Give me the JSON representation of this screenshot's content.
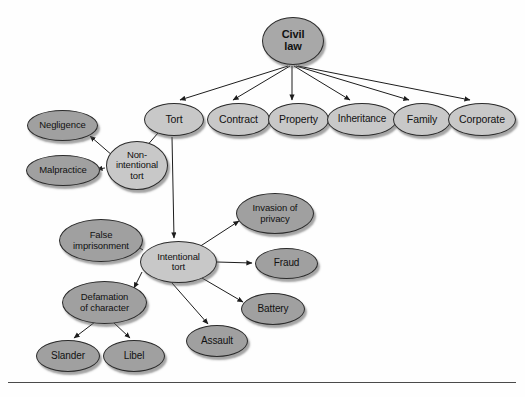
{
  "diagram": {
    "colors": {
      "root_fill": "#a8a8a8",
      "branch_fill": "#c8c8c8",
      "leaf_fill": "#a0a0a0",
      "stroke": "#2b2b2b",
      "background": "#fefefe",
      "baseline": "#4a4a4a"
    },
    "nodes": [
      {
        "id": "civil_law",
        "label": "Civil law",
        "lines": [
          "Civil",
          "law"
        ],
        "x": 262,
        "y": 17,
        "w": 62,
        "h": 48,
        "style": "root",
        "font": 11
      },
      {
        "id": "tort",
        "label": "Tort",
        "lines": [
          "Tort"
        ],
        "x": 144,
        "y": 103,
        "w": 60,
        "h": 33,
        "style": "light",
        "font": 10.5
      },
      {
        "id": "contract",
        "label": "Contract",
        "lines": [
          "Contract"
        ],
        "x": 207,
        "y": 103,
        "w": 63,
        "h": 33,
        "style": "light",
        "font": 10.5
      },
      {
        "id": "property",
        "label": "Property",
        "lines": [
          "Property"
        ],
        "x": 268,
        "y": 103,
        "w": 61,
        "h": 33,
        "style": "light",
        "font": 10.5
      },
      {
        "id": "inheritance",
        "label": "Inheritance",
        "lines": [
          "Inheritance"
        ],
        "x": 327,
        "y": 103,
        "w": 70,
        "h": 33,
        "style": "light",
        "font": 10
      },
      {
        "id": "family",
        "label": "Family",
        "lines": [
          "Family"
        ],
        "x": 393,
        "y": 103,
        "w": 58,
        "h": 33,
        "style": "light",
        "font": 10.5
      },
      {
        "id": "corporate",
        "label": "Corporate",
        "lines": [
          "Corporate"
        ],
        "x": 448,
        "y": 103,
        "w": 68,
        "h": 33,
        "style": "light",
        "font": 10.5
      },
      {
        "id": "non_intentional",
        "label": "Non-intentional tort",
        "lines": [
          "Non-",
          "intentional",
          "tort"
        ],
        "x": 106,
        "y": 141,
        "w": 62,
        "h": 49,
        "style": "light",
        "font": 9.5
      },
      {
        "id": "negligence",
        "label": "Negligence",
        "lines": [
          "Negligence"
        ],
        "x": 27,
        "y": 110,
        "w": 71,
        "h": 31,
        "style": "dark",
        "font": 9.5
      },
      {
        "id": "malpractice",
        "label": "Malpractice",
        "lines": [
          "Malpractice"
        ],
        "x": 26,
        "y": 155,
        "w": 74,
        "h": 31,
        "style": "dark",
        "font": 9.5
      },
      {
        "id": "intentional",
        "label": "Intentional tort",
        "lines": [
          "Intentional",
          "tort"
        ],
        "x": 140,
        "y": 241,
        "w": 77,
        "h": 42,
        "style": "light",
        "font": 9.5
      },
      {
        "id": "invasion_privacy",
        "label": "Invasion of privacy",
        "lines": [
          "Invasion of",
          "privacy"
        ],
        "x": 236,
        "y": 193,
        "w": 78,
        "h": 41,
        "style": "dark",
        "font": 9.5
      },
      {
        "id": "fraud",
        "label": "Fraud",
        "lines": [
          "Fraud"
        ],
        "x": 255,
        "y": 248,
        "w": 63,
        "h": 31,
        "style": "dark",
        "font": 10
      },
      {
        "id": "battery",
        "label": "Battery",
        "lines": [
          "Battery"
        ],
        "x": 241,
        "y": 293,
        "w": 64,
        "h": 32,
        "style": "dark",
        "font": 10
      },
      {
        "id": "assault",
        "label": "Assault",
        "lines": [
          "Assault"
        ],
        "x": 186,
        "y": 325,
        "w": 62,
        "h": 32,
        "style": "dark",
        "font": 10
      },
      {
        "id": "false_imprison",
        "label": "False imprisonment",
        "lines": [
          "False",
          "imprisonment"
        ],
        "x": 59,
        "y": 219,
        "w": 84,
        "h": 43,
        "style": "dark",
        "font": 9.5
      },
      {
        "id": "defamation",
        "label": "Defamation of character",
        "lines": [
          "Defamation",
          "of character"
        ],
        "x": 62,
        "y": 281,
        "w": 85,
        "h": 43,
        "style": "dark",
        "font": 9.5
      },
      {
        "id": "slander",
        "label": "Slander",
        "lines": [
          "Slander"
        ],
        "x": 36,
        "y": 340,
        "w": 64,
        "h": 32,
        "style": "dark",
        "font": 10
      },
      {
        "id": "libel",
        "label": "Libel",
        "lines": [
          "Libel"
        ],
        "x": 103,
        "y": 340,
        "w": 62,
        "h": 32,
        "style": "dark",
        "font": 10
      }
    ],
    "edges": [
      {
        "from": "civil_law",
        "to": "tort",
        "x1": 288,
        "y1": 66,
        "x2": 180,
        "y2": 100
      },
      {
        "from": "civil_law",
        "to": "contract",
        "x1": 290,
        "y1": 66,
        "x2": 233,
        "y2": 100
      },
      {
        "from": "civil_law",
        "to": "property",
        "x1": 292,
        "y1": 66,
        "x2": 292,
        "y2": 100
      },
      {
        "from": "civil_law",
        "to": "inheritance",
        "x1": 294,
        "y1": 66,
        "x2": 350,
        "y2": 100
      },
      {
        "from": "civil_law",
        "to": "family",
        "x1": 296,
        "y1": 66,
        "x2": 409,
        "y2": 100
      },
      {
        "from": "civil_law",
        "to": "corporate",
        "x1": 298,
        "y1": 66,
        "x2": 470,
        "y2": 100
      },
      {
        "from": "tort",
        "to": "non_intentional",
        "x1": 158,
        "y1": 133,
        "x2": 145,
        "y2": 148
      },
      {
        "from": "tort",
        "to": "intentional",
        "x1": 172,
        "y1": 137,
        "x2": 174,
        "y2": 238
      },
      {
        "from": "non_intentional",
        "to": "negligence",
        "x1": 113,
        "y1": 156,
        "x2": 90,
        "y2": 136
      },
      {
        "from": "non_intentional",
        "to": "malpractice",
        "x1": 105,
        "y1": 168,
        "x2": 97,
        "y2": 169
      },
      {
        "from": "intentional",
        "to": "invasion_privacy",
        "x1": 199,
        "y1": 247,
        "x2": 239,
        "y2": 221
      },
      {
        "from": "intentional",
        "to": "fraud",
        "x1": 217,
        "y1": 262,
        "x2": 252,
        "y2": 263
      },
      {
        "from": "intentional",
        "to": "battery",
        "x1": 202,
        "y1": 278,
        "x2": 243,
        "y2": 302
      },
      {
        "from": "intentional",
        "to": "assault",
        "x1": 172,
        "y1": 283,
        "x2": 208,
        "y2": 324
      },
      {
        "from": "intentional",
        "to": "false_imprison",
        "x1": 143,
        "y1": 250,
        "x2": 132,
        "y2": 243
      },
      {
        "from": "intentional",
        "to": "defamation",
        "x1": 142,
        "y1": 272,
        "x2": 134,
        "y2": 288
      },
      {
        "from": "defamation",
        "to": "slander",
        "x1": 95,
        "y1": 322,
        "x2": 74,
        "y2": 338
      },
      {
        "from": "defamation",
        "to": "libel",
        "x1": 113,
        "y1": 322,
        "x2": 130,
        "y2": 338
      }
    ],
    "baseline": {
      "x": 8,
      "y": 382,
      "w": 508
    }
  }
}
